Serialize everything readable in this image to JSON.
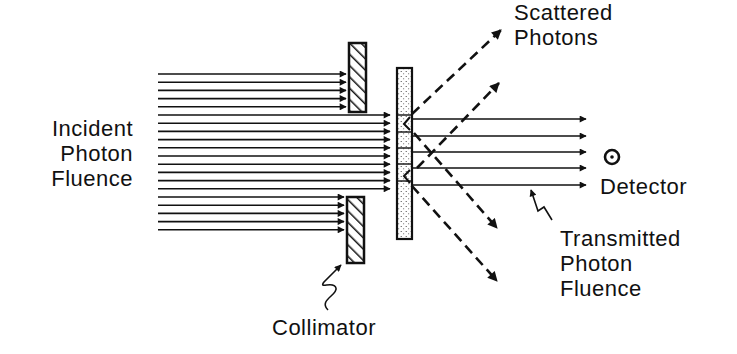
{
  "labels": {
    "incident": [
      "Incident",
      "Photon",
      "Fluence"
    ],
    "scattered": [
      "Scattered",
      "Photons"
    ],
    "detector": "Detector",
    "transmitted": [
      "Transmitted",
      "Photon",
      "Fluence"
    ],
    "collimator": "Collimator"
  },
  "geometry": {
    "incident_arrow_count": 20,
    "incident_x_start": 158,
    "incident_y_first": 74,
    "incident_spacing": 8.2,
    "blocked_top_indices": [
      0,
      1,
      2,
      3,
      4
    ],
    "passed_indices": [
      5,
      6,
      7,
      8,
      9,
      10,
      11,
      12,
      13,
      14
    ],
    "blocked_bottom_indices": [
      15,
      16,
      17,
      18,
      19
    ],
    "transmitted_y": [
      119,
      136,
      152,
      168,
      185
    ],
    "transmitted_x_end": 586
  },
  "colors": {
    "ink": "#111111",
    "background": "#ffffff"
  }
}
